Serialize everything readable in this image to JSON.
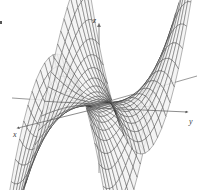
{
  "figure": {
    "title": "",
    "background_color": "#ffffff",
    "width": 205,
    "height": 190
  },
  "axes": {
    "z": {
      "label": "z",
      "label_x": 93,
      "label_y": 17,
      "line": {
        "x1": 99,
        "y1": 173,
        "x2": 99,
        "y2": 25
      },
      "arrow": true,
      "color": "#6e6e6e"
    },
    "y": {
      "label": "y",
      "label_x": 189,
      "label_y": 118,
      "line": {
        "x1": 99,
        "y1": 108,
        "x2": 187,
        "y2": 112
      },
      "arrow": true,
      "color": "#5a5a5a"
    },
    "x": {
      "label": "x",
      "label_x": 13,
      "label_y": 131,
      "line": {
        "x1": 99,
        "y1": 108,
        "x2": 18,
        "y2": 128
      },
      "arrow": true,
      "color": "#5a5a5a"
    },
    "y_negative": {
      "x1": 99,
      "y1": 104,
      "x2": 12,
      "y2": 98,
      "color": "#6e6e6e"
    },
    "x_negative": {
      "x1": 99,
      "y1": 104,
      "x2": 197,
      "y2": 76,
      "color": "#6e6e6e"
    }
  },
  "chart_data": {
    "type": "surface-3d-wireframe",
    "title": "",
    "xlabel": "x",
    "ylabel": "y",
    "zlabel": "z",
    "surface_equation": "z = x^3 - 3*x*y^2",
    "domain": {
      "u_min": -1.25,
      "u_max": 1.25,
      "v_min": -1.25,
      "v_max": 1.25
    },
    "mesh": {
      "u_steps": 26,
      "v_steps": 26,
      "line_color": "#2b2b2b",
      "line_width": 0.35,
      "fill_color": "#f2f2f2",
      "fill_opacity": 0.82
    },
    "projection": {
      "type": "oblique-isometric",
      "origin_x": 99,
      "origin_y": 104,
      "x_axis_screen": [
        -0.62,
        0.155
      ],
      "y_axis_screen": [
        0.7,
        0.035
      ],
      "z_axis_screen": [
        0.0,
        -1.0
      ],
      "scale_x": 54,
      "scale_y": 62,
      "scale_z": 31
    },
    "grid": false,
    "legend": null,
    "annotations": []
  }
}
